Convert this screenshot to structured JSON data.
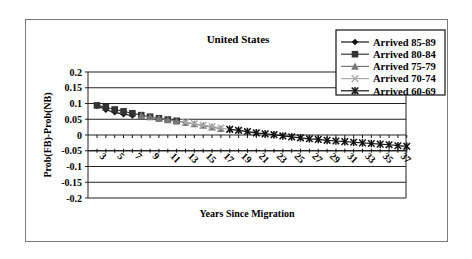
{
  "chart_data": {
    "type": "line",
    "title": "United States",
    "xlabel": "Years Since Migration",
    "ylabel": "Prob(FB)-Prob(NB)",
    "ylim": [
      -0.2,
      0.2
    ],
    "yticks": [
      "0.2",
      "0.15",
      "0.1",
      "0.05",
      "0",
      "-0.05",
      "-0.1",
      "-0.15",
      "-0.2"
    ],
    "ytick_values": [
      0.2,
      0.15,
      0.1,
      0.05,
      0,
      -0.05,
      -0.1,
      -0.15,
      -0.2
    ],
    "xtick_labels": [
      "3",
      "5",
      "7",
      "9",
      "11",
      "13",
      "15",
      "17",
      "19",
      "21",
      "23",
      "25",
      "27",
      "29",
      "31",
      "33",
      "35",
      "37"
    ],
    "x_axis_crosses_at": -0.05,
    "grid": "horizontal major gridlines",
    "legend_position": "top-right",
    "series": [
      {
        "name": "Arrived 85-89",
        "marker": "diamond",
        "color": "#111111",
        "x": [
          1,
          2,
          3,
          4,
          5
        ],
        "values": [
          0.093,
          0.08,
          0.072,
          0.066,
          0.062
        ]
      },
      {
        "name": "Arrived 80-84",
        "marker": "square",
        "color": "#333333",
        "x": [
          1,
          2,
          3,
          4,
          5,
          6,
          7,
          8,
          9,
          10
        ],
        "values": [
          0.094,
          0.088,
          0.081,
          0.075,
          0.069,
          0.063,
          0.058,
          0.053,
          0.049,
          0.045
        ]
      },
      {
        "name": "Arrived 75-79",
        "marker": "triangle",
        "color": "#777777",
        "x": [
          6,
          7,
          8,
          9,
          10,
          11,
          12,
          13,
          14,
          15
        ],
        "values": [
          0.062,
          0.057,
          0.053,
          0.048,
          0.044,
          0.039,
          0.035,
          0.03,
          0.025,
          0.02
        ]
      },
      {
        "name": "Arrived 70-74",
        "marker": "x",
        "color": "#aaaaaa",
        "x": [
          11,
          12,
          13,
          14,
          15,
          16,
          17,
          18,
          19,
          20
        ],
        "values": [
          0.04,
          0.036,
          0.031,
          0.027,
          0.022,
          0.018,
          0.014,
          0.01,
          0.006,
          0.002
        ]
      },
      {
        "name": "Arrived 60-69",
        "marker": "asterisk",
        "color": "#111111",
        "x": [
          16,
          17,
          18,
          19,
          20,
          21,
          22,
          23,
          24,
          25,
          26,
          27,
          28,
          29,
          30,
          31,
          32,
          33,
          34,
          35,
          36
        ],
        "values": [
          0.018,
          0.015,
          0.011,
          0.007,
          0.004,
          0.001,
          -0.003,
          -0.006,
          -0.009,
          -0.012,
          -0.014,
          -0.017,
          -0.019,
          -0.021,
          -0.023,
          -0.025,
          -0.027,
          -0.029,
          -0.031,
          -0.034,
          -0.036
        ]
      }
    ]
  }
}
